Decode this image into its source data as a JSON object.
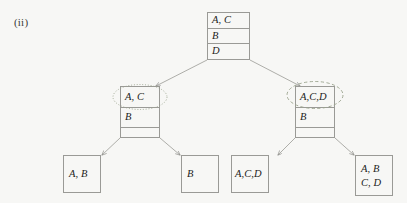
{
  "figure": {
    "label": "(ii)",
    "kind": "binary-tree-diagram",
    "line_color": "#9a9a96",
    "text_color": "#1d1d1b",
    "background_color": "#f7f7f5",
    "highlight_color": "#8f9a83"
  },
  "root": {
    "rows": [
      {
        "text": "A, C"
      },
      {
        "text": "B"
      },
      {
        "text": "D"
      }
    ]
  },
  "left_branch": {
    "rows": [
      {
        "text": "A, C"
      },
      {
        "text": "B"
      },
      {
        "text": ""
      }
    ],
    "highlight": "dotted-ellipse",
    "highlight_target_row": "A, C"
  },
  "right_branch": {
    "rows": [
      {
        "text": "A,C,D"
      },
      {
        "text": "B"
      },
      {
        "text": ""
      }
    ],
    "highlight": "dashed-ellipse",
    "highlight_target_row": "A,C,D"
  },
  "leaves": [
    {
      "lines": [
        "A, B"
      ]
    },
    {
      "lines": [
        "B"
      ]
    },
    {
      "lines": [
        "A,C,D"
      ]
    },
    {
      "lines": [
        "A, B",
        "C, D"
      ]
    }
  ]
}
